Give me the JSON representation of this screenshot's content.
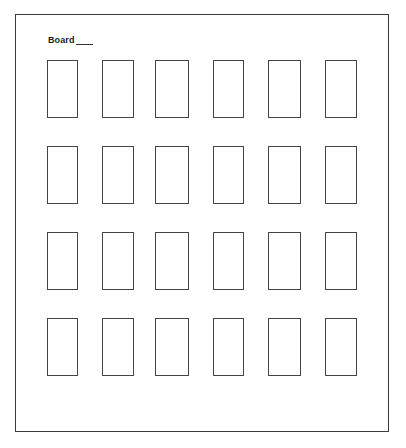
{
  "document": {
    "label": "Board",
    "blank": "",
    "grid": {
      "rows": 4,
      "columns": 6,
      "column_x": [
        47,
        102,
        155,
        213,
        268,
        325
      ],
      "column_w": [
        31,
        32,
        34,
        31,
        33,
        32
      ],
      "row_y": [
        60,
        146,
        232,
        318
      ],
      "row_h": 58,
      "line_color": "#444444"
    }
  }
}
